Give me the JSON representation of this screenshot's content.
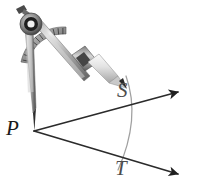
{
  "figure": {
    "background_color": "#ffffff",
    "width": 200,
    "height": 193
  },
  "labels": {
    "vertex": "P",
    "upper_intersection": "S",
    "lower_intersection": "T"
  },
  "colors": {
    "ray": "#2b2b2b",
    "arc": "#9a9a9a",
    "label_dark": "#1a1a1a",
    "label_gray": "#4d4d4d",
    "metal_light": "#e6e6e6",
    "metal_mid": "#a8a8a8",
    "metal_dark": "#5a5a5a",
    "pivot": "#1f1f1f"
  },
  "geometry": {
    "vertex_point": {
      "x": 33,
      "y": 131
    },
    "upper_ray_end": {
      "x": 186,
      "y": 90
    },
    "lower_ray_end": {
      "x": 186,
      "y": 175
    },
    "arc_radius": 92,
    "point_S": {
      "x": 114,
      "y": 110
    },
    "point_T": {
      "x": 110,
      "y": 157
    }
  },
  "icons": {
    "arrowhead": "arrowhead-icon",
    "compass": "compass-icon",
    "pivot": "compass-pivot-icon",
    "needle": "compass-needle-icon",
    "pencil": "compass-pencil-icon",
    "scale": "compass-protractor-scale-icon",
    "arc": "construction-arc-icon"
  }
}
